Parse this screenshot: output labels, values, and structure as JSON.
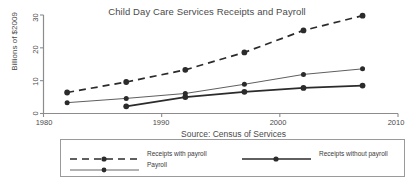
{
  "chart_data": {
    "type": "line",
    "title": "Child Day Care Services Receipts and Payroll",
    "xlabel": "Year",
    "ylabel": "Billions of $2009",
    "xlim": [
      1980,
      2010
    ],
    "ylim": [
      0,
      30
    ],
    "xticks": [
      "1980",
      "1990",
      "2000",
      "2010"
    ],
    "xtick_values": [
      1980,
      1990,
      2000,
      2010
    ],
    "yticks": [
      "0",
      "10",
      "20",
      "30"
    ],
    "ytick_values": [
      0,
      10,
      20,
      30
    ],
    "grid": false,
    "legend_position": "bottom",
    "x": [
      1982,
      1987,
      1992,
      1997,
      2002,
      2007
    ],
    "series": [
      {
        "name": "Receipts with payroll",
        "style": "dashed",
        "color": "#2b2b2b",
        "values": [
          6.4,
          9.6,
          13.3,
          18.6,
          25.3,
          29.8
        ]
      },
      {
        "name": "Receipts without payroll",
        "style": "solid-thick",
        "color": "#2b2b2b",
        "values": [
          null,
          2.2,
          5.0,
          6.6,
          7.8,
          8.5
        ]
      },
      {
        "name": "Payroll",
        "style": "solid-thin",
        "color": "#555555",
        "values": [
          3.3,
          4.6,
          6.1,
          8.9,
          11.9,
          13.6
        ]
      }
    ],
    "annotations": [
      "Source: Census of Services"
    ]
  },
  "legend": {
    "source_note": "Source: Census of Services",
    "entries": [
      {
        "label": "Receipts with payroll"
      },
      {
        "label": "Receipts without payroll"
      },
      {
        "label": "Payroll"
      }
    ]
  }
}
